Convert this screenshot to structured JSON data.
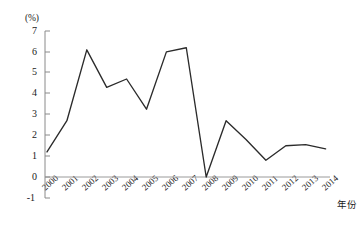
{
  "chart_data": {
    "type": "line",
    "title": "",
    "subtitle": "",
    "unit_label": "(%)",
    "xlabel": "年份",
    "ylabel": "",
    "categories": [
      "2000",
      "2001",
      "2002",
      "2003",
      "2004",
      "2005",
      "2006",
      "2007",
      "2008",
      "2009",
      "2010",
      "2011",
      "2012",
      "2013",
      "2014"
    ],
    "values": [
      1.2,
      2.7,
      6.1,
      4.3,
      4.7,
      3.25,
      6.0,
      6.2,
      0.0,
      2.7,
      1.8,
      0.8,
      1.5,
      1.55,
      1.35
    ],
    "series": [
      {
        "name": "rate",
        "values": [
          1.2,
          2.7,
          6.1,
          4.3,
          4.7,
          3.25,
          6.0,
          6.2,
          0.0,
          2.7,
          1.8,
          0.8,
          1.5,
          1.55,
          1.35
        ]
      }
    ],
    "ylim": [
      -1,
      7
    ],
    "yticks": [
      -1,
      0,
      1,
      2,
      3,
      4,
      5,
      6,
      7
    ],
    "ytick_labels": [
      "-1",
      "0",
      "1",
      "2",
      "3",
      "4",
      "5",
      "6",
      "7"
    ],
    "xtick_labels": [
      "2000",
      "2001",
      "2002",
      "2003",
      "2004",
      "2005",
      "2006",
      "2007",
      "2008",
      "2009",
      "2010",
      "2011",
      "2012",
      "2013",
      "2014"
    ],
    "grid": false,
    "legend": "none",
    "line_color": "#2b2b2b",
    "axis_color": "#808080",
    "zero_line_color": "#909090",
    "markers": false,
    "annotations": []
  }
}
